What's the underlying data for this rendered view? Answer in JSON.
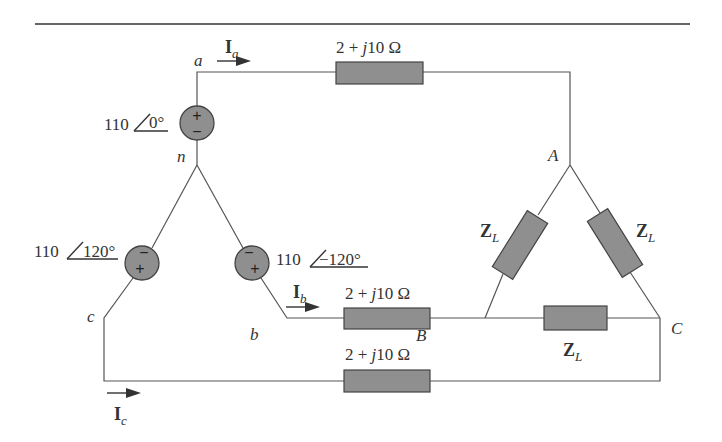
{
  "figure": {
    "type": "three-phase Y-delta circuit",
    "colors": {
      "component_fill": "#8f8f8f",
      "line": "#555555",
      "text": "#333333",
      "background": "#ffffff"
    }
  },
  "nodes": {
    "a": "a",
    "b": "b",
    "c": "c",
    "n": "n",
    "A": "A",
    "B": "B",
    "C": "C"
  },
  "sources": [
    {
      "id": "va",
      "magnitude": "110",
      "angle": "0°",
      "top_sign": "+",
      "bottom_sign": "−"
    },
    {
      "id": "vc",
      "magnitude": "110",
      "angle": "120°",
      "top_sign": "−",
      "bottom_sign": "+"
    },
    {
      "id": "vb",
      "magnitude": "110",
      "angle": "−120°",
      "top_sign": "−",
      "bottom_sign": "+"
    }
  ],
  "line_impedances": [
    {
      "id": "za_line",
      "label": "2 + ",
      "j": "j",
      "rest": "10 Ω"
    },
    {
      "id": "zb_line",
      "label": "2 + ",
      "j": "j",
      "rest": "10 Ω"
    },
    {
      "id": "zc_line",
      "label": "2 + ",
      "j": "j",
      "rest": "10 Ω"
    }
  ],
  "load_impedances": [
    {
      "id": "zab",
      "main": "Z",
      "sub": "L"
    },
    {
      "id": "zca",
      "main": "Z",
      "sub": "L"
    },
    {
      "id": "zbc",
      "main": "Z",
      "sub": "L"
    }
  ],
  "currents": [
    {
      "id": "ia",
      "main": "I",
      "sub": "a"
    },
    {
      "id": "ib",
      "main": "I",
      "sub": "b"
    },
    {
      "id": "ic",
      "main": "I",
      "sub": "c"
    }
  ]
}
